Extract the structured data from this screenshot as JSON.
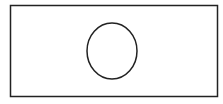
{
  "diagram": {
    "canvas": {
      "width": 223,
      "height": 104,
      "background": "#ffffff"
    },
    "shapes": [
      {
        "type": "rectangle",
        "name": "outer-rectangle",
        "x": 10.5,
        "y": 5.5,
        "width": 207,
        "height": 91,
        "stroke": "#222222",
        "stroke_width": 1.5,
        "fill": "none"
      },
      {
        "type": "ellipse",
        "name": "inner-circle",
        "cx": 112,
        "cy": 51,
        "rx": 25,
        "ry": 28,
        "stroke": "#222222",
        "stroke_width": 1.5,
        "fill": "none"
      }
    ]
  }
}
